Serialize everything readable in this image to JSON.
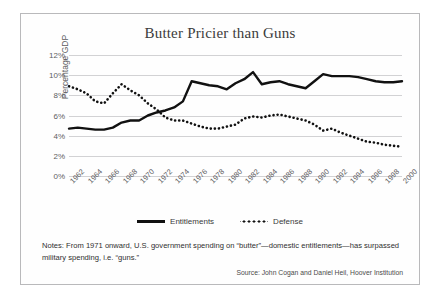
{
  "chart_data": {
    "type": "line",
    "title": "Butter Pricier than Guns",
    "xlabel": "",
    "ylabel": "Percentage GDP",
    "ylim": [
      0,
      12
    ],
    "xlim": [
      1962,
      2000
    ],
    "grid": true,
    "legend_position": "bottom",
    "y_ticks": [
      "0%",
      "2%",
      "4%",
      "6%",
      "8%",
      "10%",
      "12%"
    ],
    "y_tick_values": [
      0,
      2,
      4,
      6,
      8,
      10,
      12
    ],
    "x_tick_labels": [
      "1962",
      "1964",
      "1966",
      "1968",
      "1970",
      "1972",
      "1974",
      "1976",
      "1978",
      "1980",
      "1982",
      "1984",
      "1986",
      "1988",
      "1990",
      "1992",
      "1994",
      "1996",
      "1998",
      "2000"
    ],
    "x": [
      1962,
      1963,
      1964,
      1965,
      1966,
      1967,
      1968,
      1969,
      1970,
      1971,
      1972,
      1973,
      1974,
      1975,
      1976,
      1977,
      1978,
      1979,
      1980,
      1981,
      1982,
      1983,
      1984,
      1985,
      1986,
      1987,
      1988,
      1989,
      1990,
      1991,
      1992,
      1993,
      1994,
      1995,
      1996,
      1997,
      1998,
      1999,
      2000
    ],
    "series": [
      {
        "name": "Entitlements",
        "style": "solid",
        "color": "#111111",
        "values": [
          4.7,
          4.8,
          4.7,
          4.6,
          4.6,
          4.8,
          5.3,
          5.5,
          5.5,
          6.0,
          6.3,
          6.5,
          6.8,
          7.4,
          9.4,
          9.2,
          9.0,
          8.9,
          8.6,
          9.2,
          9.6,
          10.3,
          9.1,
          9.3,
          9.4,
          9.1,
          8.9,
          8.7,
          9.4,
          10.1,
          9.9,
          9.9,
          9.9,
          9.8,
          9.6,
          9.4,
          9.3,
          9.3,
          9.4
        ]
      },
      {
        "name": "Defense",
        "style": "dotted",
        "color": "#111111",
        "values": [
          8.9,
          8.6,
          8.2,
          7.4,
          7.2,
          8.2,
          9.1,
          8.5,
          8.0,
          7.2,
          6.6,
          5.8,
          5.5,
          5.5,
          5.2,
          4.9,
          4.7,
          4.7,
          4.9,
          5.1,
          5.7,
          5.9,
          5.8,
          6.0,
          6.1,
          5.9,
          5.7,
          5.5,
          5.1,
          4.5,
          4.7,
          4.3,
          4.0,
          3.7,
          3.4,
          3.3,
          3.1,
          3.0,
          2.9
        ]
      }
    ],
    "notes": "Notes: From 1971 onward, U.S. government spending on “butter”—domestic entitlements—has surpassed military spending, i.e. “guns.”",
    "source": "Source: John Cogan and Daniel Heil, Hoover Institution"
  }
}
